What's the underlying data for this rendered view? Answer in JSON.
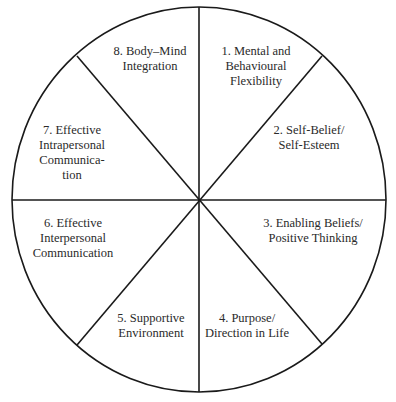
{
  "diagram": {
    "type": "wheel",
    "segments_count": 8,
    "colors": {
      "stroke": "#1a1a1a",
      "fill": "#ffffff",
      "text": "#2a2a2a"
    },
    "segments": [
      {
        "number": 1,
        "lines": [
          "1. Mental and",
          "Behavioural",
          "Flexibility"
        ]
      },
      {
        "number": 2,
        "lines": [
          "2. Self-Belief/",
          "Self-Esteem"
        ]
      },
      {
        "number": 3,
        "lines": [
          "3. Enabling Beliefs/",
          "Positive Thinking"
        ]
      },
      {
        "number": 4,
        "lines": [
          "4. Purpose/",
          "Direction in Life"
        ]
      },
      {
        "number": 5,
        "lines": [
          "5. Supportive",
          "Environment"
        ]
      },
      {
        "number": 6,
        "lines": [
          "6. Effective",
          "Interpersonal",
          "Communication"
        ]
      },
      {
        "number": 7,
        "lines": [
          "7. Effective",
          "Intrapersonal",
          "Communica-",
          "tion"
        ]
      },
      {
        "number": 8,
        "lines": [
          "8. Body–Mind",
          "Integration"
        ]
      }
    ]
  }
}
